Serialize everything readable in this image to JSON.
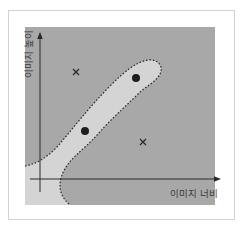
{
  "diagram": {
    "x_axis_label": "이미지 너비",
    "y_axis_label": "이미지 높이",
    "colors": {
      "background": "#ffffff",
      "frame_border": "#d2d2d2",
      "plot_area": "#a8a8a8",
      "positive_region": "#d4d4d4",
      "boundary": "#2a2a2a",
      "axis": "#2a2a2a",
      "marker": "#2a2a2a"
    },
    "positive_points": [
      {
        "label": "dot",
        "x": 136,
        "y": 78
      },
      {
        "label": "dot",
        "x": 85,
        "y": 131
      }
    ],
    "negative_points": [
      {
        "label": "x",
        "x": 76,
        "y": 72
      },
      {
        "label": "x",
        "x": 143,
        "y": 142
      }
    ]
  }
}
